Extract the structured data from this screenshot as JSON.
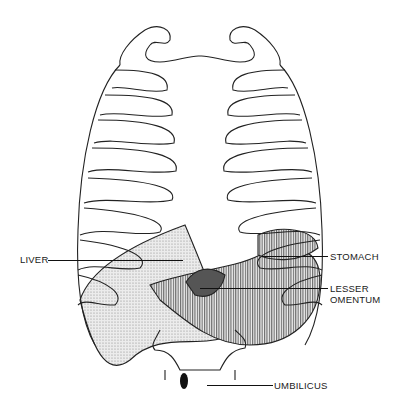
{
  "figure": {
    "colors": {
      "line": "#222222",
      "stipple": "#d8d8d8",
      "hatch": "#9a9a9a",
      "background": "#ffffff"
    }
  },
  "labels": {
    "liver": "LIVER",
    "stomach": "STOMACH",
    "lesser_omentum_line1": "LESSER",
    "lesser_omentum_line2": "OMENTUM",
    "umbilicus": "UMBILICUS"
  }
}
